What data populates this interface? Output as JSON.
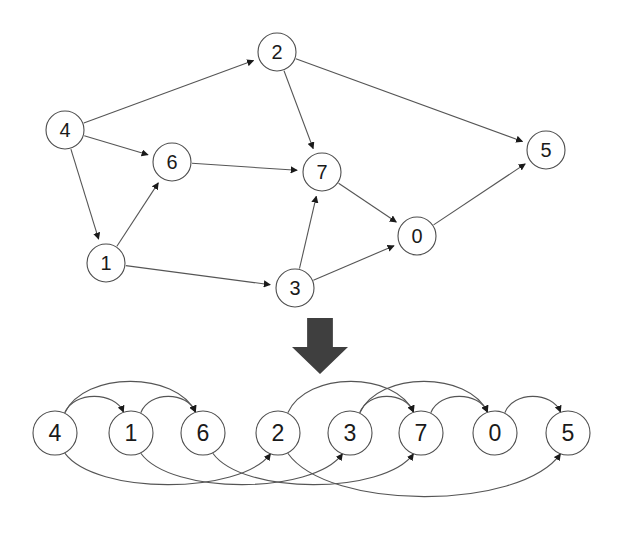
{
  "figure": {
    "caption": "",
    "background_color": "#ffffff",
    "node_fill": "#ffffff",
    "node_stroke": "#4d4d4d",
    "edge_color": "#555555",
    "arrow_color": "#1a1a1a",
    "label_color": "#1a1a1a",
    "big_arrow_color": "#3f3f3f"
  },
  "graph_top": {
    "name": "original-directed-graph",
    "node_radius": 19,
    "nodes": [
      {
        "id": "4",
        "label": "4",
        "x": 65,
        "y": 130
      },
      {
        "id": "2",
        "label": "2",
        "x": 277,
        "y": 52
      },
      {
        "id": "6",
        "label": "6",
        "x": 172,
        "y": 162
      },
      {
        "id": "7",
        "label": "7",
        "x": 322,
        "y": 172
      },
      {
        "id": "5",
        "label": "5",
        "x": 546,
        "y": 150
      },
      {
        "id": "1",
        "label": "1",
        "x": 106,
        "y": 263
      },
      {
        "id": "3",
        "label": "3",
        "x": 295,
        "y": 288
      },
      {
        "id": "0",
        "label": "0",
        "x": 417,
        "y": 236
      }
    ],
    "edges": [
      {
        "from": "4",
        "to": "2"
      },
      {
        "from": "4",
        "to": "6"
      },
      {
        "from": "4",
        "to": "1"
      },
      {
        "from": "1",
        "to": "6"
      },
      {
        "from": "1",
        "to": "3"
      },
      {
        "from": "6",
        "to": "7"
      },
      {
        "from": "2",
        "to": "7"
      },
      {
        "from": "2",
        "to": "5"
      },
      {
        "from": "3",
        "to": "7"
      },
      {
        "from": "3",
        "to": "0"
      },
      {
        "from": "7",
        "to": "0"
      },
      {
        "from": "0",
        "to": "5"
      }
    ]
  },
  "transform_arrow": {
    "name": "downward-transform-arrow",
    "x": 292,
    "y": 318,
    "width": 56,
    "height": 56
  },
  "graph_bottom": {
    "name": "topological-order-layout",
    "node_radius": 22,
    "baseline_y": 433,
    "order": [
      "4",
      "1",
      "6",
      "2",
      "3",
      "7",
      "0",
      "5"
    ],
    "nodes": [
      {
        "id": "4",
        "label": "4",
        "x": 55,
        "y": 433
      },
      {
        "id": "1",
        "label": "1",
        "x": 131,
        "y": 433
      },
      {
        "id": "6",
        "label": "6",
        "x": 203,
        "y": 433
      },
      {
        "id": "2",
        "label": "2",
        "x": 278,
        "y": 433
      },
      {
        "id": "3",
        "label": "3",
        "x": 350,
        "y": 433
      },
      {
        "id": "7",
        "label": "7",
        "x": 421,
        "y": 433
      },
      {
        "id": "0",
        "label": "0",
        "x": 495,
        "y": 433
      },
      {
        "id": "5",
        "label": "5",
        "x": 568,
        "y": 433
      }
    ],
    "edges": [
      {
        "from": "4",
        "to": "1",
        "side": "above",
        "bow": 42
      },
      {
        "from": "4",
        "to": "6",
        "side": "above",
        "bow": 62
      },
      {
        "from": "1",
        "to": "6",
        "side": "above",
        "bow": 42
      },
      {
        "from": "2",
        "to": "7",
        "side": "above",
        "bow": 62
      },
      {
        "from": "3",
        "to": "7",
        "side": "above",
        "bow": 42
      },
      {
        "from": "3",
        "to": "0",
        "side": "above",
        "bow": 62
      },
      {
        "from": "7",
        "to": "0",
        "side": "above",
        "bow": 42
      },
      {
        "from": "0",
        "to": "5",
        "side": "above",
        "bow": 42
      },
      {
        "from": "4",
        "to": "2",
        "side": "below",
        "bow": 62
      },
      {
        "from": "1",
        "to": "3",
        "side": "below",
        "bow": 62
      },
      {
        "from": "6",
        "to": "7",
        "side": "below",
        "bow": 62
      },
      {
        "from": "2",
        "to": "5",
        "side": "below",
        "bow": 78
      }
    ]
  }
}
